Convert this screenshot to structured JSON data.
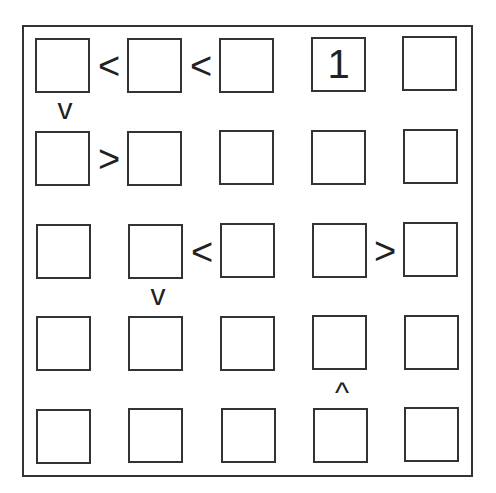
{
  "puzzle": {
    "type": "futoshiki",
    "size": 5,
    "grid": [
      [
        "",
        "",
        "",
        "1",
        ""
      ],
      [
        "",
        "",
        "",
        "",
        ""
      ],
      [
        "",
        "",
        "",
        "",
        ""
      ],
      [
        "",
        "",
        "",
        "",
        ""
      ],
      [
        "",
        "",
        "",
        "",
        ""
      ]
    ],
    "horizontal_constraints": [
      {
        "row": 1,
        "between_cols": [
          1,
          2
        ],
        "symbol": "<"
      },
      {
        "row": 1,
        "between_cols": [
          2,
          3
        ],
        "symbol": "<"
      },
      {
        "row": 2,
        "between_cols": [
          1,
          2
        ],
        "symbol": ">"
      },
      {
        "row": 3,
        "between_cols": [
          2,
          3
        ],
        "symbol": "<"
      },
      {
        "row": 3,
        "between_cols": [
          4,
          5
        ],
        "symbol": ">"
      }
    ],
    "vertical_constraints": [
      {
        "col": 1,
        "between_rows": [
          1,
          2
        ],
        "symbol": "v"
      },
      {
        "col": 2,
        "between_rows": [
          3,
          4
        ],
        "symbol": "v"
      },
      {
        "col": 4,
        "between_rows": [
          4,
          5
        ],
        "symbol": "^"
      }
    ]
  },
  "labels": {
    "r1c4": "1",
    "h_r1_12": "<",
    "h_r1_23": "<",
    "h_r2_12": ">",
    "h_r3_23": "<",
    "h_r3_45": ">",
    "v_c1_12": "v",
    "v_c2_34": "v",
    "v_c4_45": "^"
  }
}
